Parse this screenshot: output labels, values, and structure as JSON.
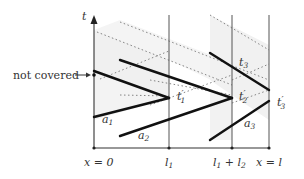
{
  "diagram": {
    "axis": {
      "t_label": "t",
      "x_ticks": [
        {
          "label": "x = 0",
          "x": 94
        },
        {
          "label": "l",
          "sub": "1",
          "x": 169
        },
        {
          "label": "l",
          "sub": "1",
          "suffix": " + l",
          "sub2": "2",
          "x": 232
        },
        {
          "label": "x = l",
          "x": 269
        }
      ]
    },
    "annotations": {
      "not_covered": "not covered",
      "t1p": {
        "base": "t",
        "sub": "1",
        "prime": "′"
      },
      "t2p": {
        "base": "t",
        "sub": "2",
        "prime": "′"
      },
      "t3p": {
        "base": "t",
        "sub": "3",
        "prime": "′"
      },
      "t3": {
        "base": "t",
        "sub": "3"
      },
      "a1": {
        "base": "a",
        "sub": "1"
      },
      "a2": {
        "base": "a",
        "sub": "2"
      },
      "a3": {
        "base": "a",
        "sub": "3"
      }
    },
    "colors": {
      "line": "#111111",
      "axis": "#555555",
      "shade": "#efefef",
      "dots": "#777777"
    }
  }
}
